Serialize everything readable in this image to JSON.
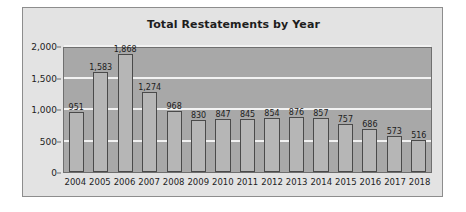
{
  "chart_data": {
    "type": "bar",
    "title": "Total Restatements by Year",
    "xlabel": "",
    "ylabel": "",
    "categories": [
      "2004",
      "2005",
      "2006",
      "2007",
      "2008",
      "2009",
      "2010",
      "2011",
      "2012",
      "2013",
      "2014",
      "2015",
      "2016",
      "2017",
      "2018"
    ],
    "values": [
      951,
      1583,
      1868,
      1274,
      968,
      830,
      847,
      845,
      854,
      876,
      857,
      757,
      686,
      573,
      516
    ],
    "value_labels": [
      "951",
      "1,583",
      "1,868",
      "1,274",
      "968",
      "830",
      "847",
      "845",
      "854",
      "876",
      "857",
      "757",
      "686",
      "573",
      "516"
    ],
    "ylim": [
      0,
      2000
    ],
    "yticks": [
      0,
      500,
      1000,
      1500,
      2000
    ],
    "ytick_labels": [
      "0",
      "500",
      "1,000",
      "1,500",
      "2,000"
    ],
    "grid": true,
    "legend": "none",
    "colors": {
      "bar_fill": "#b6b6b6",
      "bar_border": "#4a4a4a",
      "plot_background": "#a8a8a8",
      "chart_background": "#e3e3e3",
      "gridline": "#f2f2f2",
      "text": "#1d1d1d",
      "frame_border": "#8d8d8d"
    }
  }
}
